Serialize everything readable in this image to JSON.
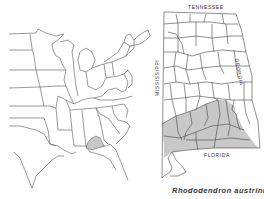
{
  "figure": {
    "caption": "Rhododendron austrinum",
    "stroke_color": "#444444",
    "shade_color": "#c8c8c8",
    "background": "#ffffff"
  },
  "regional_map": {
    "description": "Eastern United States state outlines with species range shaded",
    "shaded_region": "Southern Alabama and western Florida panhandle"
  },
  "state_map": {
    "state": "Alabama",
    "labels": {
      "north": "TENNESSEE",
      "east": "GEORGIA",
      "west": "MISSISSIPPI",
      "south": "FLORIDA"
    },
    "shaded_region": "Southern Alabama counties"
  }
}
